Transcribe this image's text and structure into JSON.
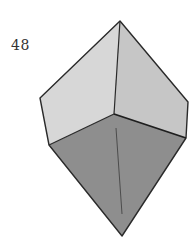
{
  "figure": {
    "step_number": "48",
    "colors": {
      "upper_left_face": "#d7d7d7",
      "upper_right_face": "#c6c6c6",
      "lower_face": "#8e8e8e",
      "outline": "#2a2a2a",
      "crease": "#444444"
    }
  }
}
